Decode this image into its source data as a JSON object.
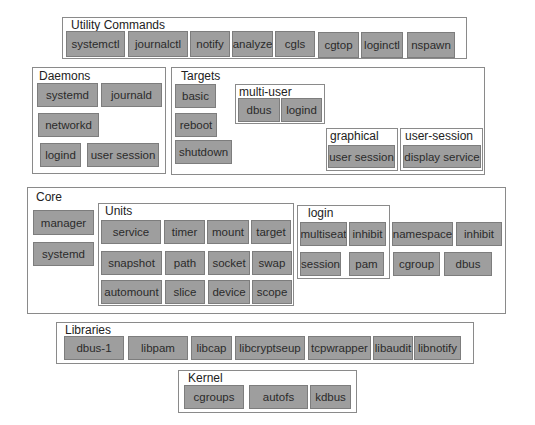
{
  "utility": {
    "title": "Utility Commands",
    "items": [
      "systemctl",
      "journalctl",
      "notify",
      "analyze",
      "cgls",
      "cgtop",
      "loginctl",
      "nspawn"
    ]
  },
  "daemons": {
    "title": "Daemons",
    "items": [
      "systemd",
      "journald",
      "networkd",
      "logind",
      "user session"
    ]
  },
  "targets": {
    "title": "Targets",
    "items": [
      "basic",
      "reboot",
      "shutdown"
    ],
    "multi_user": {
      "title": "multi-user",
      "items": [
        "dbus",
        "logind"
      ]
    },
    "graphical": {
      "title": "graphical",
      "items": [
        "user session"
      ]
    },
    "user_session": {
      "title": "user-session",
      "items": [
        "display service"
      ]
    }
  },
  "core": {
    "title": "Core",
    "items": [
      "manager",
      "systemd"
    ],
    "units": {
      "title": "Units",
      "items": [
        "service",
        "timer",
        "mount",
        "target",
        "snapshot",
        "path",
        "socket",
        "swap",
        "automount",
        "slice",
        "device",
        "scope"
      ]
    },
    "login": {
      "title": "login",
      "items": [
        "multiseat",
        "inhibit",
        "session",
        "pam"
      ]
    },
    "extra": [
      "namespace",
      "inhibit",
      "cgroup",
      "dbus"
    ]
  },
  "libraries": {
    "title": "Libraries",
    "items": [
      "dbus-1",
      "libpam",
      "libcap",
      "libcryptseup",
      "tcpwrapper",
      "libaudit",
      "libnotify"
    ]
  },
  "kernel": {
    "title": "Kernel",
    "items": [
      "cgroups",
      "autofs",
      "kdbus"
    ]
  }
}
